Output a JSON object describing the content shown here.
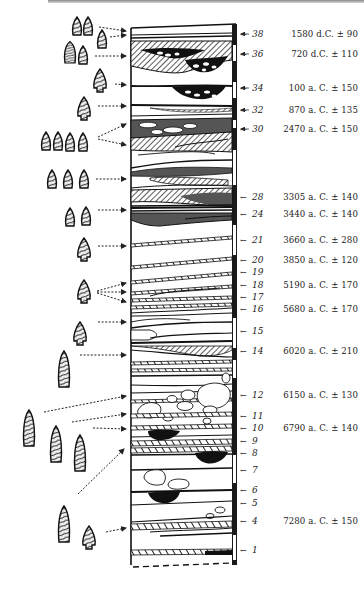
{
  "figure": {
    "type": "stratigraphic-section",
    "colors": {
      "ink": "#1a1a1a",
      "hatch": "#555555",
      "fill_dark": "#111111",
      "paper": "#ffffff"
    }
  },
  "layers": [
    {
      "num": "38",
      "date": "1580 d.C. ±  90",
      "y": 34
    },
    {
      "num": "36",
      "date": "720 d.C. ± 110",
      "y": 54
    },
    {
      "num": "34",
      "date": "100 a. C. ± 150",
      "y": 88
    },
    {
      "num": "32",
      "date": "870 a. C. ± 135",
      "y": 110
    },
    {
      "num": "30",
      "date": "2470 a. C. ± 150",
      "y": 129
    },
    {
      "num": "28",
      "date": "3305 a. C. ± 140",
      "y": 197
    },
    {
      "num": "24",
      "date": "3440 a. C. ± 140",
      "y": 214
    },
    {
      "num": "21",
      "date": "3660 a. C. ± 280",
      "y": 240
    },
    {
      "num": "20",
      "date": "3850 a. C. ± 120",
      "y": 260
    },
    {
      "num": "19",
      "date": "",
      "y": 272
    },
    {
      "num": "18",
      "date": "5190 a. C. ± 170",
      "y": 285
    },
    {
      "num": "17",
      "date": "",
      "y": 297
    },
    {
      "num": "16",
      "date": "5680 a. C. ± 170",
      "y": 309
    },
    {
      "num": "15",
      "date": "",
      "y": 331
    },
    {
      "num": "14",
      "date": "6020 a. C. ± 210",
      "y": 351
    },
    {
      "num": "12",
      "date": "6150 a. C. ± 130",
      "y": 395
    },
    {
      "num": "11",
      "date": "",
      "y": 416
    },
    {
      "num": "10",
      "date": "6790 a. C. ± 140",
      "y": 428
    },
    {
      "num": "9",
      "date": "",
      "y": 441
    },
    {
      "num": "8",
      "date": "",
      "y": 453
    },
    {
      "num": "7",
      "date": "",
      "y": 470
    },
    {
      "num": "6",
      "date": "",
      "y": 490
    },
    {
      "num": "5",
      "date": "",
      "y": 503
    },
    {
      "num": "4",
      "date": "7280 a. C. ± 150",
      "y": 521
    },
    {
      "num": "1",
      "date": "",
      "y": 550
    }
  ],
  "artifact_groups": [
    {
      "count": 2,
      "target_layer": "38",
      "y": 27
    },
    {
      "count": 1,
      "target_layer": "38",
      "y": 40
    },
    {
      "count": 2,
      "target_layer": "36",
      "y": 56
    },
    {
      "count": 1,
      "target_layer": "34",
      "y": 80
    },
    {
      "count": 1,
      "target_layer": "32",
      "y": 107
    },
    {
      "count": 4,
      "target_layer": "30",
      "y": 140
    },
    {
      "count": 3,
      "target_layer": "28",
      "y": 179
    },
    {
      "count": 2,
      "target_layer": "24",
      "y": 217
    },
    {
      "count": 1,
      "target_layer": "21",
      "y": 250
    },
    {
      "count": 1,
      "target_layer": "18",
      "y": 291
    },
    {
      "count": 1,
      "target_layer": "16",
      "y": 332
    },
    {
      "count": 1,
      "target_layer": "14",
      "y": 367
    },
    {
      "count": 3,
      "target_layer": "12-9",
      "y": 430
    },
    {
      "count": 2,
      "target_layer": "4",
      "y": 520
    }
  ]
}
